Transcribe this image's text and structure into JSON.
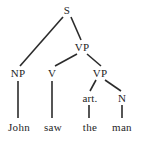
{
  "figure": {
    "kind": "syntax-tree-diagram",
    "sentence": "John saw the man",
    "background_color": "#ffffff",
    "line_color": "#2b2b2b",
    "text_color": "#242424"
  },
  "nodes": {
    "s": {
      "label": "S",
      "x": 67,
      "y": 10
    },
    "np": {
      "label": "NP",
      "x": 18,
      "y": 73
    },
    "vp1": {
      "label": "VP",
      "x": 82,
      "y": 47
    },
    "v": {
      "label": "V",
      "x": 52,
      "y": 73
    },
    "vp2": {
      "label": "VP",
      "x": 100,
      "y": 73
    },
    "art": {
      "label": "art.",
      "x": 90,
      "y": 98
    },
    "n": {
      "label": "N",
      "x": 122,
      "y": 98
    }
  },
  "terminals": {
    "john": {
      "label": "John",
      "x": 19,
      "y": 127
    },
    "saw": {
      "label": "saw",
      "x": 53,
      "y": 127
    },
    "the": {
      "label": "the",
      "x": 90,
      "y": 127
    },
    "man": {
      "label": "man",
      "x": 122,
      "y": 127
    }
  },
  "edges": [
    {
      "name": "edge-s-np",
      "x1": 63,
      "y1": 17,
      "x2": 20,
      "y2": 66
    },
    {
      "name": "edge-s-vp1",
      "x1": 71,
      "y1": 17,
      "x2": 81,
      "y2": 40
    },
    {
      "name": "edge-vp1-v",
      "x1": 77,
      "y1": 54,
      "x2": 55,
      "y2": 66
    },
    {
      "name": "edge-vp1-vp2",
      "x1": 87,
      "y1": 54,
      "x2": 101,
      "y2": 66
    },
    {
      "name": "edge-vp2-art",
      "x1": 96,
      "y1": 80,
      "x2": 90,
      "y2": 91
    },
    {
      "name": "edge-vp2-n",
      "x1": 105,
      "y1": 80,
      "x2": 121,
      "y2": 91
    },
    {
      "name": "stem-np-john",
      "x1": 18,
      "y1": 81,
      "x2": 18,
      "y2": 118
    },
    {
      "name": "stem-v-saw",
      "x1": 52,
      "y1": 81,
      "x2": 52,
      "y2": 118
    },
    {
      "name": "stem-art-the",
      "x1": 89,
      "y1": 105,
      "x2": 89,
      "y2": 118
    },
    {
      "name": "stem-n-man",
      "x1": 122,
      "y1": 105,
      "x2": 122,
      "y2": 118
    }
  ]
}
